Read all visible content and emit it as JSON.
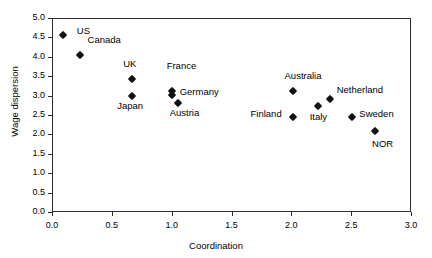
{
  "chart_data": {
    "type": "scatter",
    "title": "",
    "xlabel": "Coordination",
    "ylabel": "Wage dispersion",
    "xlim": [
      0.0,
      3.0
    ],
    "ylim": [
      0.0,
      5.0
    ],
    "grid": false,
    "legend": "none",
    "xticks": [
      "0.0",
      "0.5",
      "1.0",
      "1.5",
      "2.0",
      "2.5",
      "3.0"
    ],
    "xtick_values": [
      0.0,
      0.5,
      1.0,
      1.5,
      2.0,
      2.5,
      3.0
    ],
    "yticks": [
      "0.0",
      "0.5",
      "1.0",
      "1.5",
      "2.0",
      "2.5",
      "3.0",
      "3.5",
      "4.0",
      "4.5",
      "5.0"
    ],
    "ytick_values": [
      0.0,
      0.5,
      1.0,
      1.5,
      2.0,
      2.5,
      3.0,
      3.5,
      4.0,
      4.5,
      5.0
    ],
    "marker": "diamond",
    "marker_color": "#111111",
    "points": [
      {
        "label": "US",
        "x": 0.09,
        "y": 4.55,
        "label_dx": 14,
        "label_dy": -4
      },
      {
        "label": "Canada",
        "x": 0.23,
        "y": 4.05,
        "label_dx": 8,
        "label_dy": -15
      },
      {
        "label": "UK",
        "x": 0.67,
        "y": 3.42,
        "label_dx": -9,
        "label_dy": -15
      },
      {
        "label": "Japan",
        "x": 0.67,
        "y": 3.0,
        "label_dx": -15,
        "label_dy": 10
      },
      {
        "label": "France",
        "x": 1.0,
        "y": 3.12,
        "label_dx": -5,
        "label_dy": -25
      },
      {
        "label": "Germany",
        "x": 1.0,
        "y": 3.02,
        "label_dx": 8,
        "label_dy": -3
      },
      {
        "label": "Austria",
        "x": 1.05,
        "y": 2.82,
        "label_dx": -8,
        "label_dy": 10
      },
      {
        "label": "Finland",
        "x": 2.01,
        "y": 2.44,
        "label_dx": -42,
        "label_dy": -3
      },
      {
        "label": "Australia",
        "x": 2.01,
        "y": 3.12,
        "label_dx": -8,
        "label_dy": -15
      },
      {
        "label": "Italy",
        "x": 2.22,
        "y": 2.72,
        "label_dx": -8,
        "label_dy": 11
      },
      {
        "label": "Netherland",
        "x": 2.32,
        "y": 2.92,
        "label_dx": 7,
        "label_dy": -9
      },
      {
        "label": "Sweden",
        "x": 2.51,
        "y": 2.45,
        "label_dx": 7,
        "label_dy": -3
      },
      {
        "label": "NOR",
        "x": 2.7,
        "y": 2.08,
        "label_dx": -3,
        "label_dy": 13
      }
    ]
  }
}
